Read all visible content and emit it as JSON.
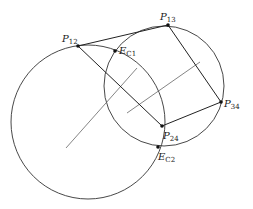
{
  "diagram": {
    "circles": [
      {
        "name": "C1",
        "cx": 88,
        "cy": 122,
        "r": 77
      },
      {
        "name": "C2",
        "cx": 164,
        "cy": 86,
        "r": 60
      }
    ],
    "points": {
      "P12": {
        "x": 78,
        "y": 46
      },
      "P13": {
        "x": 168,
        "y": 25
      },
      "P34": {
        "x": 221,
        "y": 102
      },
      "P24": {
        "x": 162,
        "y": 126
      },
      "EC1": {
        "x": 115,
        "y": 51
      },
      "EC2": {
        "x": 158,
        "y": 147
      }
    },
    "labels": {
      "P12": {
        "main": "P",
        "sub": "12"
      },
      "P13": {
        "main": "P",
        "sub": "13"
      },
      "P34": {
        "main": "P",
        "sub": "34"
      },
      "P24": {
        "main": "P",
        "sub": "24"
      },
      "EC1": {
        "main": "E",
        "sub": "C1"
      },
      "EC2": {
        "main": "E",
        "sub": "C2"
      }
    },
    "center_lines": [
      {
        "x1": 66,
        "y1": 148,
        "x2": 137,
        "y2": 68
      },
      {
        "x1": 127,
        "y1": 113,
        "x2": 200,
        "y2": 62
      }
    ],
    "colors": {
      "stroke": "#333333",
      "center_line": "#666666",
      "point": "#111111"
    }
  }
}
